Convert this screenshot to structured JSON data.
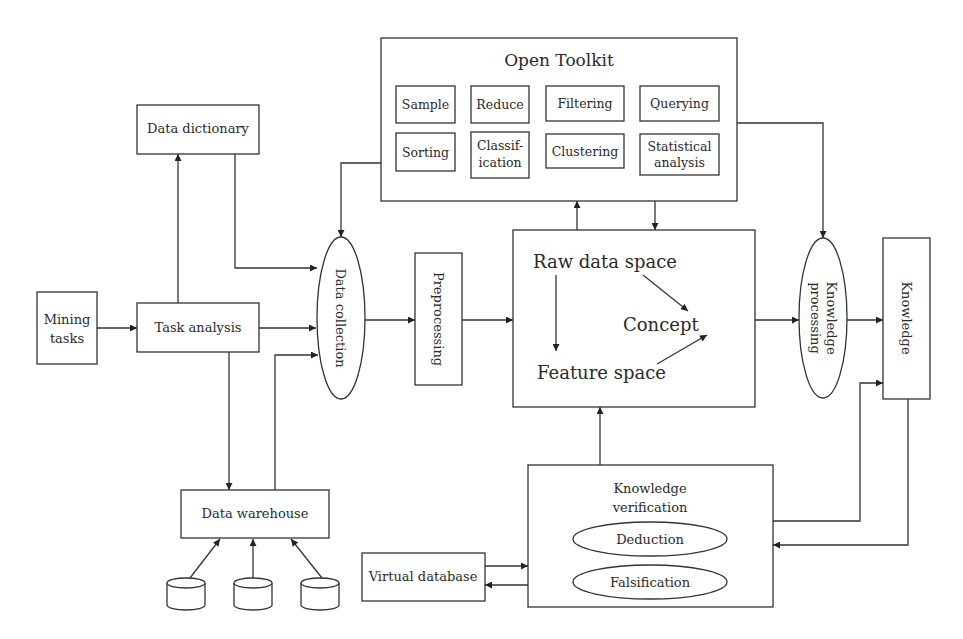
{
  "diagram": {
    "open_toolkit": {
      "title": "Open Toolkit",
      "tools": [
        "Sample",
        "Reduce",
        "Filtering",
        "Querying",
        "Sorting",
        "Classif-",
        "ication",
        "Clustering",
        "Statistical",
        "analysis"
      ]
    },
    "nodes": {
      "mining_tasks": [
        "Mining",
        "tasks"
      ],
      "task_analysis": "Task analysis",
      "data_dictionary": "Data dictionary",
      "data_collection": "Data collection",
      "data_warehouse": "Data warehouse",
      "preprocessing": "Preprocessing",
      "raw_data_space": "Raw data space",
      "concept": "Concept",
      "feature_space": "Feature space",
      "knowledge_processing": [
        "Knowledge",
        "processing"
      ],
      "knowledge": "Knowledge",
      "knowledge_verification": [
        "Knowledge",
        "verification"
      ],
      "deduction": "Deduction",
      "falsification": "Falsification",
      "virtual_database": "Virtual database"
    },
    "edges": [
      {
        "from": "Mining tasks",
        "to": "Task analysis"
      },
      {
        "from": "Task analysis",
        "to": "Data dictionary"
      },
      {
        "from": "Task analysis",
        "to": "Data collection"
      },
      {
        "from": "Task analysis",
        "to": "Data warehouse"
      },
      {
        "from": "Data dictionary",
        "to": "Data collection"
      },
      {
        "from": "Data warehouse",
        "to": "Data collection"
      },
      {
        "from": "Database 1",
        "to": "Data warehouse"
      },
      {
        "from": "Database 2",
        "to": "Data warehouse"
      },
      {
        "from": "Database 3",
        "to": "Data warehouse"
      },
      {
        "from": "Open Toolkit",
        "to": "Data collection"
      },
      {
        "from": "Data collection",
        "to": "Preprocessing"
      },
      {
        "from": "Preprocessing",
        "to": "Mining core"
      },
      {
        "from": "Mining core",
        "to": "Open Toolkit"
      },
      {
        "from": "Open Toolkit",
        "to": "Mining core"
      },
      {
        "from": "Open Toolkit",
        "to": "Knowledge processing"
      },
      {
        "from": "Mining core",
        "to": "Knowledge processing"
      },
      {
        "from": "Knowledge processing",
        "to": "Knowledge"
      },
      {
        "from": "Knowledge verification",
        "to": "Mining core"
      },
      {
        "from": "Knowledge verification",
        "to": "Knowledge"
      },
      {
        "from": "Knowledge",
        "to": "Knowledge verification"
      },
      {
        "from": "Virtual database",
        "to": "Knowledge verification"
      },
      {
        "from": "Knowledge verification",
        "to": "Virtual database"
      },
      {
        "from": "Raw data space",
        "to": "Feature space"
      },
      {
        "from": "Raw data space",
        "to": "Concept"
      },
      {
        "from": "Feature space",
        "to": "Concept"
      }
    ]
  }
}
